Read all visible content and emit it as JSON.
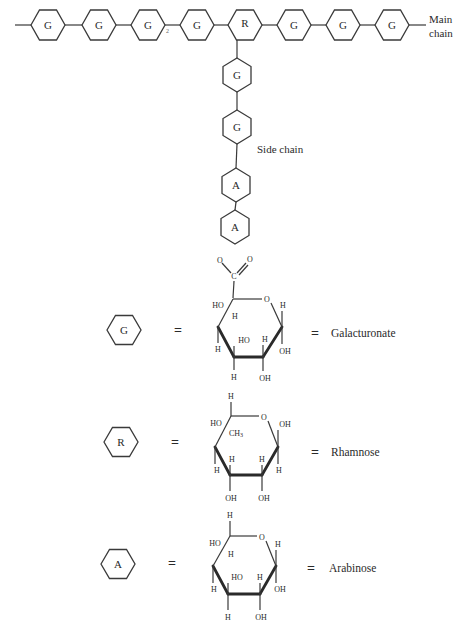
{
  "main_chain": {
    "label_line1": "Main",
    "label_line2": "chain",
    "units": [
      "G",
      "G",
      "G",
      "G",
      "R",
      "G",
      "G",
      "G"
    ],
    "linkage_mark": "2"
  },
  "side_chain": {
    "label": "Side chain",
    "units": [
      "G",
      "G",
      "A",
      "A"
    ]
  },
  "legend": [
    {
      "symbol": "G",
      "equals": "=",
      "name": "Galacturonate",
      "structure": {
        "carboxyl_c": "C",
        "carboxyl_o1": "O",
        "carboxyl_o2": "O",
        "ring_o": "O",
        "c5_sub_left": "HO",
        "c5_sub_down": "H",
        "c1_up": "H",
        "c1_down": "OH",
        "c4_down": "H",
        "c3_up": "HO",
        "c3_down": "H",
        "c2_up": "H",
        "c2_down": "OH"
      }
    },
    {
      "symbol": "R",
      "equals": "=",
      "name": "Rhamnose",
      "structure": {
        "c5_up": "H",
        "c5_left": "HO",
        "c5_methyl": "CH",
        "c5_methyl_sub": "3",
        "ring_o": "O",
        "c1_up": "OH",
        "c1_down": "H",
        "c4_down": "H",
        "c3_up": "H",
        "c3_down": "OH",
        "c2_up": "H",
        "c2_down": "OH"
      }
    },
    {
      "symbol": "A",
      "equals": "=",
      "name": "Arabinose",
      "structure": {
        "c5_up": "H",
        "c5_left": "HO",
        "c5_down": "H",
        "ring_o": "O",
        "c1_up": "H",
        "c1_down": "OH",
        "c4_down": "H",
        "c3_up": "HO",
        "c3_down": "H",
        "c2_up": "H",
        "c2_down": "OH"
      }
    }
  ]
}
